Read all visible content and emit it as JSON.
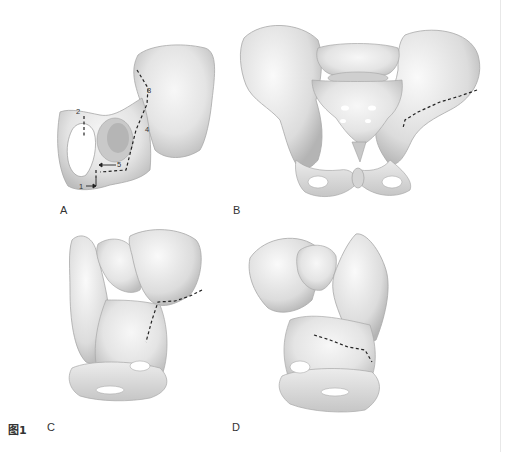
{
  "figure": {
    "number_label": "图1",
    "panels": [
      {
        "id": "A",
        "label": "A",
        "view": "lateral view of hemipelvis with osteotomy lines",
        "markers": [
          "1",
          "2",
          "3",
          "4",
          "5"
        ]
      },
      {
        "id": "B",
        "label": "B",
        "view": "anterior view of pelvis with dashed osteotomy line on right ilium"
      },
      {
        "id": "C",
        "label": "C",
        "view": "oblique view of pelvis with dashed osteotomy line"
      },
      {
        "id": "D",
        "label": "D",
        "view": "oblique view of pelvis (opposite side) with dashed osteotomy line"
      }
    ]
  },
  "colors": {
    "bone_light": "#f2f2f2",
    "bone_mid": "#d9d9d9",
    "bone_shadow": "#b8b8b8",
    "bone_outline": "#9a9a9a",
    "dash_line": "#222222",
    "background": "#ffffff"
  }
}
